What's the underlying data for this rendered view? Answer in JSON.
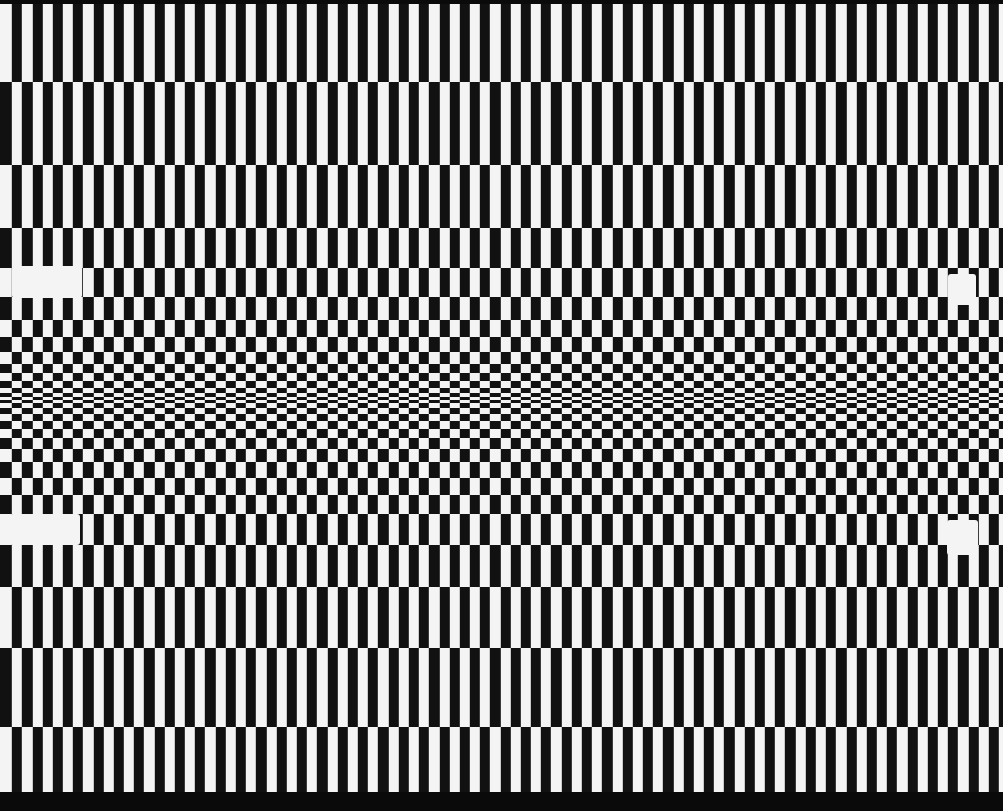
{
  "pattern": {
    "type": "perspective-checkerboard",
    "colors": {
      "dark": "#111111",
      "light": "#f4f4f4",
      "border": "#0a0a0a"
    },
    "column_period_px": 20.35,
    "column_offset_px": 12,
    "top_border": [
      0,
      4
    ],
    "bottom_border": [
      792,
      811
    ],
    "row_boundaries": [
      4,
      82,
      165,
      228,
      268,
      297,
      320,
      337,
      352,
      364,
      373,
      381,
      388,
      393,
      397,
      400,
      403,
      408,
      414,
      421,
      429,
      438,
      449,
      462,
      478,
      495,
      514,
      545,
      587,
      648,
      727,
      792
    ]
  },
  "markers": [
    {
      "name": "marker-top-left",
      "x": 12,
      "y": 266,
      "w": 70,
      "h": 32
    },
    {
      "name": "marker-top-right",
      "x": 948,
      "y": 274,
      "w": 28,
      "h": 31
    },
    {
      "name": "marker-bottom-left",
      "x": 10,
      "y": 514,
      "w": 70,
      "h": 31
    },
    {
      "name": "marker-bottom-right",
      "x": 947,
      "y": 520,
      "w": 31,
      "h": 35
    }
  ]
}
